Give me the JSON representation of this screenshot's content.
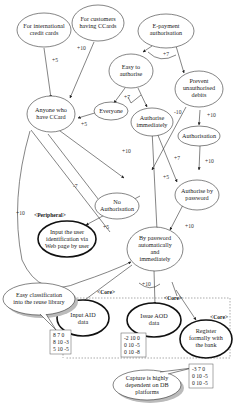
{
  "nodes": {
    "intl_cards": [
      "For international",
      "credit cards"
    ],
    "ccards_customers": [
      "For customers",
      "having CCards"
    ],
    "epayment": [
      "E-payment",
      "authorisation"
    ],
    "easy_auth": [
      "Easy to",
      "authorise"
    ],
    "prevent_debits": [
      "Prevent",
      "unauthorised",
      "debits"
    ],
    "everyone": [
      "Everyone"
    ],
    "anyone_ccard": [
      "Anyone who",
      "have CCard"
    ],
    "auth_immediately": [
      "Authorise",
      "immediately"
    ],
    "authorisation": [
      "Authorisation"
    ],
    "no_auth": [
      "No",
      "Authorisation"
    ],
    "auth_password": [
      "Authorise by",
      "password"
    ],
    "input_user_id": [
      "Input the user",
      "identification via",
      "Web page by user"
    ],
    "by_password_auto": [
      "By password",
      "automatically",
      "and",
      "immediately"
    ],
    "input_aid": [
      "Input AID",
      "data"
    ],
    "issue_aod": [
      "Issue AOD",
      "data"
    ],
    "register_bank": [
      "Register",
      "formally with",
      "the bank"
    ]
  },
  "edge_labels": {
    "intl_to_anyone": "+5",
    "ccards_to_anyone": "+10",
    "epay_easy": "+7",
    "easy_split": "+7",
    "everyone_anyone": "+5",
    "prevent_noauth": "-10",
    "prevent_authorisation": "+10",
    "anyone_noauth": "+10",
    "anyone_left": "-7",
    "anyone_bypass": "+10",
    "immediate_authpw": "+7",
    "immediate_bypw": "+5",
    "authorisation_authpw": "+10",
    "authpw_bypw": "+10",
    "noauth_input": "+5",
    "bypw_aod": "+10"
  },
  "tags": {
    "peripheral": "<Peripheral>",
    "core_left": "<Core>",
    "core_mid": "<Core>",
    "core_right": "<Core>"
  },
  "callouts": {
    "reuse_library": [
      "Easy classification",
      "into the reuse library"
    ],
    "db_platforms": [
      "Capture is highly",
      "dependent on DB",
      "platforms"
    ]
  },
  "matrices": {
    "left": [
      "8  7  0",
      "8 10 -3",
      "5 10 -5"
    ],
    "middle": [
      "-2 10  0",
      "0 10 -5",
      "0 10 -8"
    ],
    "right": [
      "-3  7  0",
      "0 10 -5",
      "0 10 -5"
    ]
  }
}
